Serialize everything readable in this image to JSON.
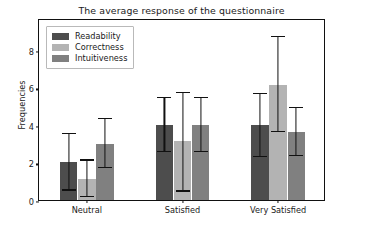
{
  "chart_data": {
    "type": "bar",
    "title": "The average response of the questionnaire",
    "xlabel": "",
    "ylabel": "Frequencies",
    "categories": [
      "Neutral",
      "Satisfied",
      "Very Satisfied"
    ],
    "yticks": [
      0,
      2,
      4,
      6,
      8
    ],
    "ylim": [
      0,
      9.7
    ],
    "grid": false,
    "legend_position": "upper left",
    "orientation": "vertical",
    "error_bars": true,
    "series": [
      {
        "name": "Readability",
        "color": "#4d4d4d",
        "values": [
          2.0,
          4.0,
          4.0
        ],
        "err_low": [
          0.5,
          2.55,
          2.3
        ],
        "err_high": [
          3.5,
          5.45,
          5.65
        ]
      },
      {
        "name": "Correctness",
        "color": "#b3b3b3",
        "values": [
          1.1,
          3.15,
          6.15
        ],
        "err_low": [
          0.15,
          0.45,
          3.6
        ],
        "err_high": [
          2.1,
          5.7,
          8.7
        ]
      },
      {
        "name": "Intuitiveness",
        "color": "#808080",
        "values": [
          3.0,
          4.0,
          3.65
        ],
        "err_low": [
          1.7,
          2.55,
          2.35
        ],
        "err_high": [
          4.3,
          5.45,
          4.9
        ]
      }
    ]
  }
}
